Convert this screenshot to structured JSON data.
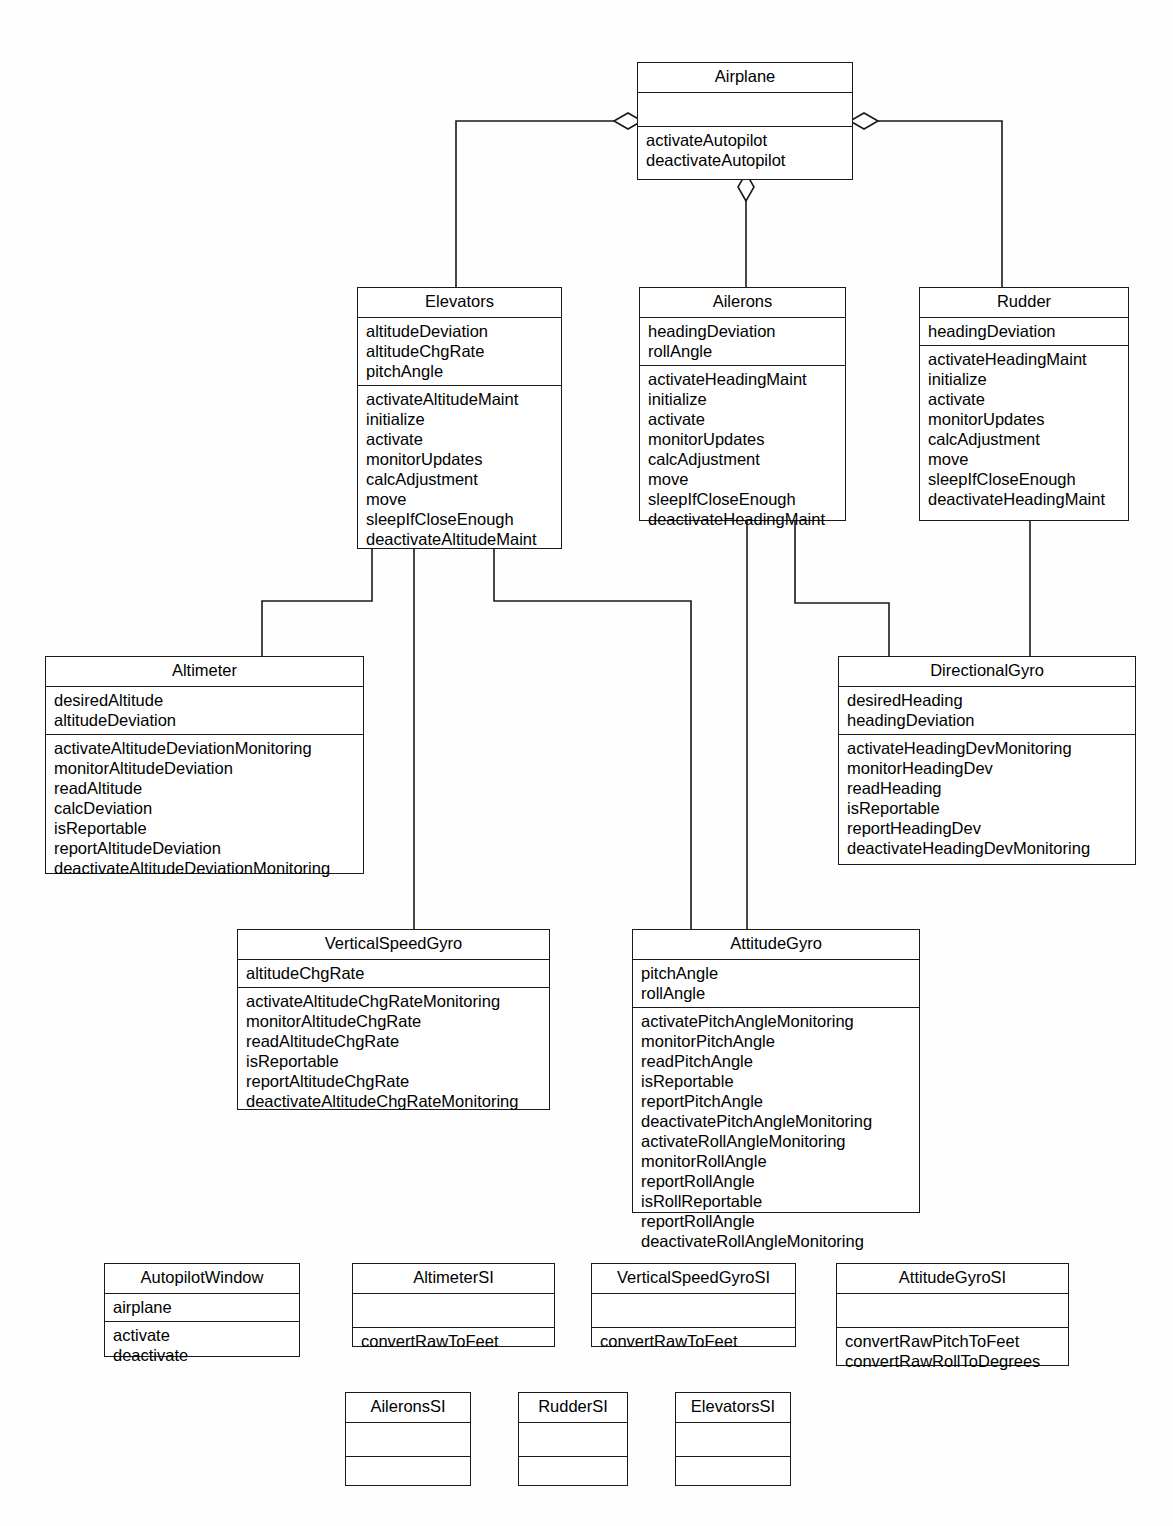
{
  "diagram": {
    "type": "uml-class-diagram",
    "stroke_color": "#1a1a1a",
    "background_color": "#fefefe"
  },
  "classes": {
    "airplane": {
      "name": "Airplane",
      "attributes": [],
      "operations": [
        "activateAutopilot",
        "deactivateAutopilot"
      ]
    },
    "elevators": {
      "name": "Elevators",
      "attributes": [
        "altitudeDeviation",
        "altitudeChgRate",
        "pitchAngle"
      ],
      "operations": [
        "activateAltitudeMaint",
        "initialize",
        "activate",
        "monitorUpdates",
        "calcAdjustment",
        "move",
        "sleepIfCloseEnough",
        "deactivateAltitudeMaint"
      ]
    },
    "ailerons": {
      "name": "Ailerons",
      "attributes": [
        "headingDeviation",
        "rollAngle"
      ],
      "operations": [
        "activateHeadingMaint",
        "initialize",
        "activate",
        "monitorUpdates",
        "calcAdjustment",
        "move",
        "sleepIfCloseEnough",
        "deactivateHeadingMaint"
      ]
    },
    "rudder": {
      "name": "Rudder",
      "attributes": [
        "headingDeviation"
      ],
      "operations": [
        "activateHeadingMaint",
        "initialize",
        "activate",
        "monitorUpdates",
        "calcAdjustment",
        "move",
        "sleepIfCloseEnough",
        "deactivateHeadingMaint"
      ]
    },
    "altimeter": {
      "name": "Altimeter",
      "attributes": [
        "desiredAltitude",
        "altitudeDeviation"
      ],
      "operations": [
        "activateAltitudeDeviationMonitoring",
        "monitorAltitudeDeviation",
        "readAltitude",
        "calcDeviation",
        "isReportable",
        "reportAltitudeDeviation",
        "deactivateAltitudeDeviationMonitoring"
      ]
    },
    "directionalgyro": {
      "name": "DirectionalGyro",
      "attributes": [
        "desiredHeading",
        "headingDeviation"
      ],
      "operations": [
        "activateHeadingDevMonitoring",
        "monitorHeadingDev",
        "readHeading",
        "isReportable",
        "reportHeadingDev",
        "deactivateHeadingDevMonitoring"
      ]
    },
    "verticalspeedgyro": {
      "name": "VerticalSpeedGyro",
      "attributes": [
        "altitudeChgRate"
      ],
      "operations": [
        "activateAltitudeChgRateMonitoring",
        "monitorAltitudeChgRate",
        "readAltitudeChgRate",
        "isReportable",
        "reportAltitudeChgRate",
        "deactivateAltitudeChgRateMonitoring"
      ]
    },
    "attitudegyro": {
      "name": "AttitudeGyro",
      "attributes": [
        "pitchAngle",
        "rollAngle"
      ],
      "operations": [
        "activatePitchAngleMonitoring",
        "monitorPitchAngle",
        "readPitchAngle",
        "isReportable",
        "reportPitchAngle",
        "deactivatePitchAngleMonitoring",
        "activateRollAngleMonitoring",
        "monitorRollAngle",
        "reportRollAngle",
        "isRollReportable",
        "reportRollAngle",
        "deactivateRollAngleMonitoring"
      ]
    },
    "autopilotwindow": {
      "name": "AutopilotWindow",
      "attributes": [
        "airplane"
      ],
      "operations": [
        "activate",
        "deactivate"
      ]
    },
    "altimetersi": {
      "name": "AltimeterSI",
      "attributes": [],
      "operations": [
        "convertRawToFeet"
      ]
    },
    "verticalspeedgyrosi": {
      "name": "VerticalSpeedGyroSI",
      "attributes": [],
      "operations": [
        "convertRawToFeet"
      ]
    },
    "attitudegyrosi": {
      "name": "AttitudeGyroSI",
      "attributes": [],
      "operations": [
        "convertRawPitchToFeet",
        "convertRawRollToDegrees"
      ]
    },
    "aileronssi": {
      "name": "AileronsSI",
      "attributes": [],
      "operations": []
    },
    "ruddersi": {
      "name": "RudderSI",
      "attributes": [],
      "operations": []
    },
    "elevatorssi": {
      "name": "ElevatorsSI",
      "attributes": [],
      "operations": []
    }
  },
  "relationships": [
    {
      "from": "Airplane",
      "to": "Elevators",
      "type": "aggregation"
    },
    {
      "from": "Airplane",
      "to": "Ailerons",
      "type": "aggregation"
    },
    {
      "from": "Airplane",
      "to": "Rudder",
      "type": "aggregation"
    },
    {
      "from": "Elevators",
      "to": "Altimeter",
      "type": "association"
    },
    {
      "from": "Elevators",
      "to": "VerticalSpeedGyro",
      "type": "association"
    },
    {
      "from": "Elevators",
      "to": "AttitudeGyro",
      "type": "association"
    },
    {
      "from": "Ailerons",
      "to": "AttitudeGyro",
      "type": "association"
    },
    {
      "from": "Ailerons",
      "to": "DirectionalGyro",
      "type": "association"
    },
    {
      "from": "Rudder",
      "to": "DirectionalGyro",
      "type": "association"
    }
  ]
}
